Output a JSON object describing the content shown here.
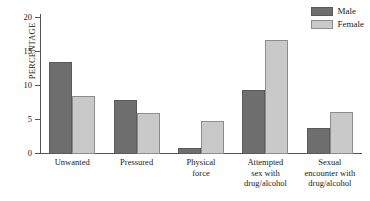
{
  "chart_data": {
    "type": "bar",
    "title": "",
    "xlabel": "",
    "ylabel": "PERCENTAGE",
    "ylim": [
      0,
      20
    ],
    "yticks": [
      0,
      5,
      10,
      15,
      20
    ],
    "ytick_labels": [
      "0",
      "5",
      "10",
      "15",
      "20"
    ],
    "grid": false,
    "legend_position": "top-right",
    "categories": [
      "Unwanted",
      "Pressured",
      "Physical force",
      "Attempted sex with drug/alcohol",
      "Sexual encounter with drug/alcohol"
    ],
    "category_lines": [
      [
        "Unwanted"
      ],
      [
        "Pressured"
      ],
      [
        "Physical",
        "force"
      ],
      [
        "Attempted",
        "sex with",
        "drug/alcohol"
      ],
      [
        "Sexual",
        "encounter with",
        "drug/alcohol"
      ]
    ],
    "series": [
      {
        "name": "Male",
        "color": "#6e6e6e",
        "values": [
          13.5,
          8.0,
          0.9,
          9.4,
          3.8
        ]
      },
      {
        "name": "Female",
        "color": "#c9c9c9",
        "values": [
          8.5,
          6.1,
          4.8,
          16.8,
          6.2
        ]
      }
    ]
  },
  "legend": {
    "items": [
      {
        "label": "Male"
      },
      {
        "label": "Female"
      }
    ]
  },
  "colors": {
    "male": "#6e6e6e",
    "female": "#c9c9c9",
    "axis": "#555555",
    "text": "#1a1a1a",
    "background": "#ffffff"
  }
}
